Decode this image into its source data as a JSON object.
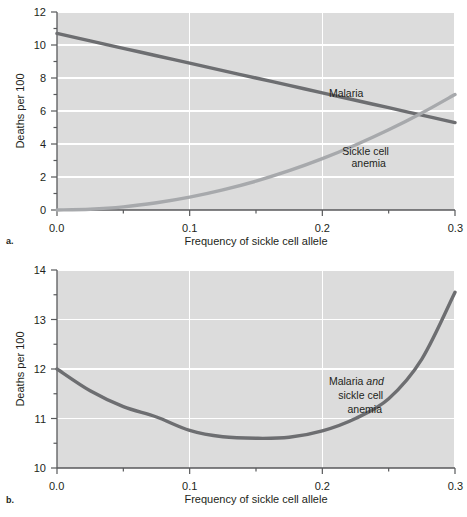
{
  "figure": {
    "panels": [
      {
        "letter": "a.",
        "name": "panel-a"
      },
      {
        "letter": "b.",
        "name": "panel-b"
      }
    ]
  },
  "colors": {
    "plot_background": "#dcdcdc",
    "gridline": "#ffffff",
    "axis": "#58595b",
    "malaria_line": "#6d6e71",
    "sickle_line": "#a7a9ac",
    "combined_line": "#6d6e71",
    "text": "#231f20"
  },
  "chart_data": [
    {
      "type": "line",
      "panel": "a",
      "title": "",
      "xlabel": "Frequency of sickle cell allele",
      "ylabel": "Deaths per 100",
      "xlim": [
        0.0,
        0.3
      ],
      "ylim": [
        0,
        12
      ],
      "grid": true,
      "legend_position": "inline-annotation",
      "xticks": [
        0.0,
        0.1,
        0.2,
        0.3
      ],
      "xticklabels": [
        "0.0",
        "0.1",
        "0.2",
        "0.3"
      ],
      "xminorticks": [
        0.05,
        0.15,
        0.25
      ],
      "yticks": [
        0,
        2,
        4,
        6,
        8,
        10,
        12
      ],
      "yticklabels": [
        "0",
        "2",
        "4",
        "6",
        "8",
        "10",
        "12"
      ],
      "yminorticks": [
        1,
        3,
        5,
        7,
        9,
        11
      ],
      "x": [
        0.0,
        0.025,
        0.05,
        0.075,
        0.1,
        0.125,
        0.15,
        0.175,
        0.2,
        0.225,
        0.25,
        0.275,
        0.3
      ],
      "series": [
        {
          "name": "Malaria",
          "label": "Malaria",
          "color": "#6d6e71",
          "values": [
            10.7,
            10.25,
            9.8,
            9.35,
            8.9,
            8.45,
            8.0,
            7.55,
            7.1,
            6.65,
            6.2,
            5.75,
            5.3
          ]
        },
        {
          "name": "Sickle cell anemia",
          "label": "Sickle cell\nanemia",
          "label_line1": "Sickle cell",
          "label_line2": "anemia",
          "color": "#a7a9ac",
          "values": [
            0.0,
            0.05,
            0.19,
            0.44,
            0.78,
            1.22,
            1.75,
            2.38,
            3.11,
            3.94,
            4.86,
            5.88,
            7.0
          ]
        }
      ],
      "annotations": [
        {
          "text": "Malaria",
          "x": 0.205,
          "y": 6.85
        },
        {
          "text": "Sickle cell",
          "x": 0.215,
          "y": 3.35
        },
        {
          "text": "anemia",
          "x": 0.222,
          "y": 2.6
        }
      ]
    },
    {
      "type": "line",
      "panel": "b",
      "title": "",
      "xlabel": "Frequency of sickle cell allele",
      "ylabel": "Deaths per 100",
      "xlim": [
        0.0,
        0.3
      ],
      "ylim": [
        10,
        14
      ],
      "grid": true,
      "legend_position": "inline-annotation",
      "xticks": [
        0.0,
        0.1,
        0.2,
        0.3
      ],
      "xticklabels": [
        "0.0",
        "0.1",
        "0.2",
        "0.3"
      ],
      "xminorticks": [
        0.05,
        0.15,
        0.25
      ],
      "yticks": [
        10,
        11,
        12,
        13,
        14
      ],
      "yticklabels": [
        "10",
        "11",
        "12",
        "13",
        "14"
      ],
      "yminorticks": [
        10.5,
        11.5,
        12.5,
        13.5
      ],
      "x": [
        0.0,
        0.025,
        0.05,
        0.075,
        0.1,
        0.125,
        0.15,
        0.175,
        0.2,
        0.225,
        0.25,
        0.275,
        0.3
      ],
      "series": [
        {
          "name": "Malaria and sickle cell anemia",
          "label_line1": "Malaria ",
          "label_line1_em": "and",
          "label_line2": "sickle cell",
          "label_line3": "anemia",
          "color": "#6d6e71",
          "values": [
            12.0,
            11.56,
            11.24,
            11.03,
            10.76,
            10.63,
            10.6,
            10.62,
            10.75,
            11.0,
            11.4,
            12.2,
            13.55
          ]
        }
      ],
      "annotations": [
        {
          "text_plain": "Malaria ",
          "text_em": "and",
          "x": 0.205,
          "y": 11.68
        },
        {
          "text": "sickle cell",
          "x": 0.212,
          "y": 11.4
        },
        {
          "text": "anemia",
          "x": 0.219,
          "y": 11.12
        }
      ]
    }
  ]
}
